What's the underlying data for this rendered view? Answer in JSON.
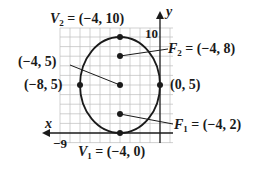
{
  "figure": {
    "type": "ellipse-graph",
    "colors": {
      "ink": "#1a1a1a",
      "grid": "#bdbdbd",
      "background": "#ffffff"
    }
  },
  "axes": {
    "x_label": "x",
    "y_label": "y",
    "x_tick_label": "−9",
    "y_tick_label": "10",
    "x_range": [
      -10,
      1
    ],
    "y_range": [
      -1,
      11
    ]
  },
  "ellipse": {
    "center": [
      -4,
      5
    ],
    "semi_major_vertical": 5,
    "semi_minor_horizontal": 4
  },
  "points": {
    "v2": {
      "name": "V",
      "sub": "2",
      "coords": "(−4, 10)",
      "x": -4,
      "y": 10
    },
    "f2": {
      "name": "F",
      "sub": "2",
      "coords": "(−4, 8)",
      "x": -4,
      "y": 8
    },
    "center": {
      "coords": "(−4, 5)",
      "x": -4,
      "y": 5
    },
    "left": {
      "coords": "(−8, 5)",
      "x": -8,
      "y": 5
    },
    "right": {
      "coords": "(0, 5)",
      "x": 0,
      "y": 5
    },
    "f1": {
      "name": "F",
      "sub": "1",
      "coords": "(−4, 2)",
      "x": -4,
      "y": 2
    },
    "v1": {
      "name": "V",
      "sub": "1",
      "coords": "(−4, 0)",
      "x": -4,
      "y": 0
    }
  },
  "labels": {
    "eq": "=",
    "v2_text": "= (−4, 10)",
    "f2_text": "= (−4, 8)",
    "center_text": "(−4, 5)",
    "left_text": "(−8, 5)",
    "right_text": "(0, 5)",
    "f1_text": "= (−4, 2)",
    "v1_text": "= (−4, 0)"
  }
}
